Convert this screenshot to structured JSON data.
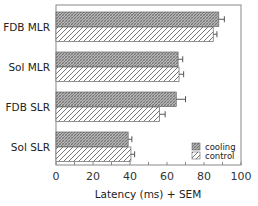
{
  "chart_data": {
    "type": "bar",
    "orientation": "horizontal",
    "title": "",
    "xlabel": "Latency (ms) + SEM",
    "ylabel": "",
    "xlim": [
      0,
      100
    ],
    "xticks": [
      0,
      20,
      40,
      60,
      80,
      100
    ],
    "xticks_minor_step": 10,
    "grid": false,
    "legend_position": "bottom-right",
    "categories": [
      "FDB MLR",
      "Sol MLR",
      "FDB SLR",
      "Sol SLR"
    ],
    "series": [
      {
        "name": "cooling",
        "pattern": "dense-crosshatch",
        "color": "#8a8a8a",
        "values": [
          88,
          66,
          65,
          39
        ],
        "errors": [
          3,
          2.5,
          5,
          2
        ]
      },
      {
        "name": "control",
        "pattern": "diagonal-hatch",
        "color": "#9a9a9a",
        "values": [
          85,
          66.5,
          56,
          40.5
        ],
        "errors": [
          2,
          2.5,
          3,
          2
        ]
      }
    ]
  }
}
